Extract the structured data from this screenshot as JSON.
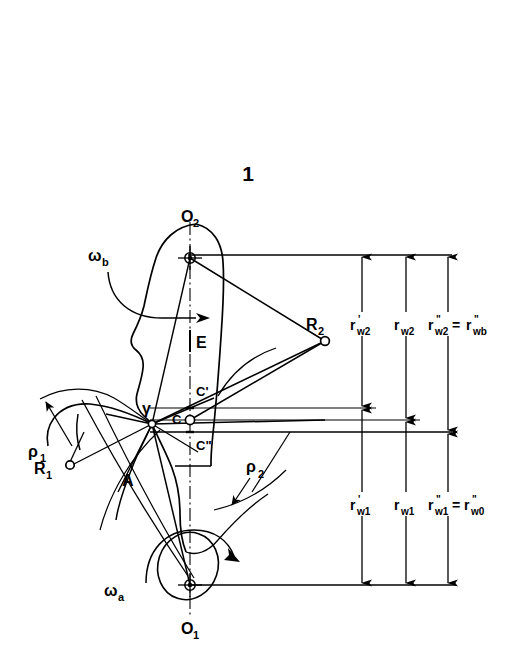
{
  "figure": {
    "number": "1",
    "title_text": "1"
  },
  "points": {
    "o2": "O",
    "o2_sub": "2",
    "o1": "O",
    "o1_sub": "1",
    "r2": "R",
    "r2_sub": "2",
    "r1": "R",
    "r1_sub": "1",
    "gamma": "γ",
    "a": "A",
    "e": "E",
    "c_prime": "C'",
    "c": "C",
    "c_double_prime": "C\""
  },
  "angular_velocities": {
    "omega_b": "ω",
    "omega_b_sub": "b",
    "omega_a": "ω",
    "omega_a_sub": "a"
  },
  "radii_of_curvature": {
    "rho1": "ρ",
    "rho1_sub": "1",
    "rho2": "ρ",
    "rho2_sub": "2"
  },
  "dimensions": {
    "top": [
      {
        "base": "r",
        "prime": "'",
        "sub": "w2",
        "full": "r'w2"
      },
      {
        "base": "r",
        "prime": "",
        "sub": "w2",
        "full": "rw2"
      },
      {
        "base": "r",
        "prime": "\"",
        "sub": "w2",
        "eq": "=",
        "base2": "r",
        "prime2": "\"",
        "sub2": "wb",
        "full": "r\"w2 = r\"wb"
      }
    ],
    "bottom": [
      {
        "base": "r",
        "prime": "'",
        "sub": "w1",
        "full": "r'w1"
      },
      {
        "base": "r",
        "prime": "",
        "sub": "w1",
        "full": "rw1"
      },
      {
        "base": "r",
        "prime": "\"",
        "sub": "w1",
        "eq": "=",
        "base2": "r",
        "prime2": "\"",
        "sub2": "w0",
        "full": "r\"w1 = r\"w0"
      }
    ]
  },
  "colors": {
    "stroke": "#000000",
    "background": "#ffffff"
  },
  "geometry": {
    "o2_xy": [
      190,
      258
    ],
    "o1_xy": [
      190,
      585
    ],
    "gamma_xy": [
      152,
      424
    ],
    "r2_xy": [
      325,
      341
    ],
    "r1_xy": [
      66,
      466
    ],
    "centerline_x": 190,
    "dim_x": [
      362,
      406,
      448
    ],
    "top_line_y": 255,
    "bottom_line_y": 585,
    "mid_y": [
      408,
      420,
      432
    ]
  }
}
